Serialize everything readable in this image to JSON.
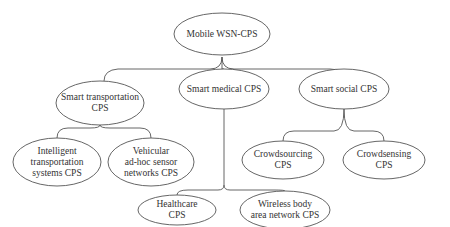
{
  "diagram": {
    "type": "tree",
    "root": {
      "id": "root",
      "lines": [
        "Mobile WSN-CPS"
      ],
      "cx": 222,
      "cy": 34,
      "rx": 48,
      "ry": 21
    },
    "nodes": [
      {
        "id": "transport",
        "parent": "root",
        "lines": [
          "Smart transportation",
          "CPS"
        ],
        "cx": 100,
        "cy": 103,
        "rx": 44,
        "ry": 22
      },
      {
        "id": "medical",
        "parent": "root",
        "lines": [
          "Smart medical CPS"
        ],
        "cx": 224,
        "cy": 89,
        "rx": 45,
        "ry": 20
      },
      {
        "id": "social",
        "parent": "root",
        "lines": [
          "Smart social CPS"
        ],
        "cx": 344,
        "cy": 89,
        "rx": 45,
        "ry": 20
      },
      {
        "id": "its",
        "parent": "transport",
        "lines": [
          "Intelligent",
          "transportation",
          "systems CPS"
        ],
        "cx": 57,
        "cy": 162,
        "rx": 44,
        "ry": 24
      },
      {
        "id": "vanet",
        "parent": "transport",
        "lines": [
          "Vehicular",
          "ad-hoc sensor",
          "networks CPS"
        ],
        "cx": 151,
        "cy": 162,
        "rx": 43,
        "ry": 24
      },
      {
        "id": "crowdsourcing",
        "parent": "social",
        "lines": [
          "Crowdsourcing",
          "CPS"
        ],
        "cx": 283,
        "cy": 160,
        "rx": 41,
        "ry": 19
      },
      {
        "id": "crowdsensing",
        "parent": "social",
        "lines": [
          "Crowdsensing",
          "CPS"
        ],
        "cx": 384,
        "cy": 160,
        "rx": 41,
        "ry": 19
      },
      {
        "id": "healthcare",
        "parent": "medical",
        "lines": [
          "Healthcare",
          "CPS"
        ],
        "cx": 177,
        "cy": 210,
        "rx": 39,
        "ry": 15
      },
      {
        "id": "wban",
        "parent": "medical",
        "lines": [
          "Wireless body",
          "area network CPS"
        ],
        "cx": 285,
        "cy": 210,
        "rx": 45,
        "ry": 19
      }
    ],
    "colors": {
      "stroke": "#555555",
      "text": "#333333",
      "background": "#ffffff"
    }
  }
}
